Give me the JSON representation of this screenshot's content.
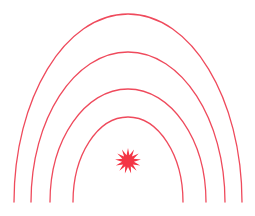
{
  "canvas": {
    "width": 255,
    "height": 216,
    "background_color": "#ffffff",
    "title": "Radiating signal wave diagram"
  },
  "palette": {
    "stroke_color": "#ef4a5c",
    "star_fill": "#f43545",
    "background": "#ffffff"
  },
  "chart_data": {
    "type": "diagram",
    "epicenter": {
      "label": "epicenter-star",
      "cx": 128,
      "cy": 161,
      "outer_radius": 13,
      "inner_radius": 6,
      "points": 13,
      "fill": "#f43545"
    },
    "baseline_y": 202,
    "arcs": [
      {
        "index": 1,
        "name": "wave-ring-1",
        "apex_y": 117,
        "half_width": 55,
        "stroke_width": 1.3,
        "opacity": 1
      },
      {
        "index": 2,
        "name": "wave-ring-2",
        "apex_y": 89,
        "half_width": 78,
        "stroke_width": 1.3,
        "opacity": 1
      },
      {
        "index": 3,
        "name": "wave-ring-3",
        "apex_y": 52,
        "half_width": 97,
        "stroke_width": 1.3,
        "opacity": 1
      },
      {
        "index": 4,
        "name": "wave-ring-4",
        "apex_y": 14,
        "half_width": 114,
        "stroke_width": 1.3,
        "opacity": 1
      }
    ],
    "xlabel": "",
    "ylabel": "",
    "grid": false,
    "legend": false
  }
}
